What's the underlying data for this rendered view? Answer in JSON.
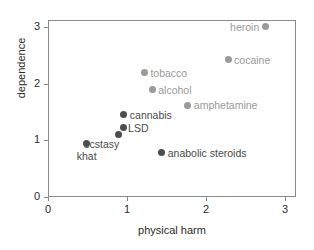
{
  "chart_data": {
    "type": "scatter",
    "title": "",
    "xlabel": "physical harm",
    "ylabel": "dependence",
    "xlim": [
      0,
      3.14
    ],
    "ylim": [
      0,
      3.12
    ],
    "xticks": [
      "0",
      "1",
      "2",
      "3"
    ],
    "yticks": [
      "0",
      "1",
      "2",
      "3"
    ],
    "grid": false,
    "legend": "none",
    "points": [
      {
        "label": "heroin",
        "x": 2.75,
        "y": 3.0,
        "color": "#9a9a9a",
        "series": "gray"
      },
      {
        "label": "cocaine",
        "x": 2.28,
        "y": 2.42,
        "color": "#9a9a9a",
        "series": "gray"
      },
      {
        "label": "tobacco",
        "x": 1.22,
        "y": 2.19,
        "color": "#9a9a9a",
        "series": "gray"
      },
      {
        "label": "alcohol",
        "x": 1.32,
        "y": 1.89,
        "color": "#9a9a9a",
        "series": "gray"
      },
      {
        "label": "amphetamine",
        "x": 1.77,
        "y": 1.62,
        "color": "#9a9a9a",
        "series": "gray"
      },
      {
        "label": "cannabis",
        "x": 0.96,
        "y": 1.45,
        "color": "#4d4d4d",
        "series": "dark"
      },
      {
        "label": "LSD",
        "x": 0.95,
        "y": 1.22,
        "color": "#4d4d4d",
        "series": "dark"
      },
      {
        "label": "ecstasy",
        "x": 0.89,
        "y": 1.11,
        "color": "#4d4d4d",
        "series": "dark"
      },
      {
        "label": "khat",
        "x": 0.49,
        "y": 0.94,
        "color": "#4d4d4d",
        "series": "dark"
      },
      {
        "label": "anabolic steroids",
        "x": 1.44,
        "y": 0.78,
        "color": "#4d4d4d",
        "series": "dark"
      }
    ]
  },
  "axes": {
    "x_title": "physical harm",
    "y_title": "dependence",
    "x_tick_labels": [
      "0",
      "1",
      "2",
      "3"
    ],
    "y_tick_labels": [
      "0",
      "1",
      "2",
      "3"
    ]
  },
  "colors": {
    "dark_marker": "#4d4d4d",
    "gray_marker": "#9a9a9a",
    "axis": "#8a8a8a",
    "text": "#2b2b2b",
    "background": "#ffffff"
  }
}
